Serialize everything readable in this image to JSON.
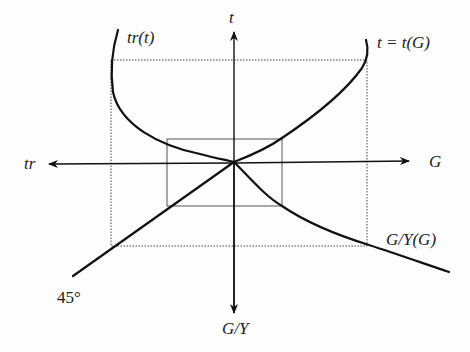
{
  "diagram": {
    "type": "four-quadrant diagram",
    "axes": {
      "up": "t",
      "right": "G",
      "left": "tr",
      "down": "G/Y"
    },
    "curves": [
      {
        "id": "tr_of_t",
        "label": "tr(t)",
        "quadrant": "upper-left"
      },
      {
        "id": "t_of_G",
        "label": "t = t(G)",
        "quadrant": "upper-right"
      },
      {
        "id": "GY_of_G",
        "label": "G/Y(G)",
        "quadrant": "lower-right"
      },
      {
        "id": "forty_five",
        "label": "45°",
        "quadrant": "lower-left"
      }
    ],
    "rectangles": [
      {
        "id": "inner",
        "style": "solid"
      },
      {
        "id": "outer",
        "style": "dotted"
      }
    ]
  }
}
